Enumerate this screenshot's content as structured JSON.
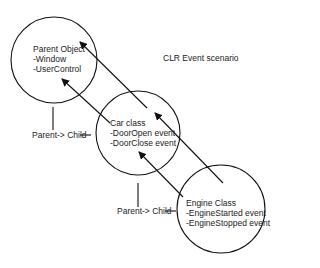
{
  "title": "CLR Event scenario",
  "nodes": [
    {
      "id": "parent",
      "title": "Parent Object",
      "lines": [
        "-Window",
        "-UserControl"
      ]
    },
    {
      "id": "car",
      "title": "Car class",
      "lines": [
        "-DoorOpen event",
        "-DoorClose event"
      ]
    },
    {
      "id": "engine",
      "title": "Engine Class",
      "lines": [
        "-EngineStarted event",
        "-EngineStopped event"
      ]
    }
  ],
  "relations": [
    {
      "label": "Parent-> Child",
      "from": "parent",
      "to": "car"
    },
    {
      "label": "Parent-> Child",
      "from": "car",
      "to": "engine"
    }
  ],
  "arrows": [
    {
      "from": "car",
      "to": "parent"
    },
    {
      "from": "car",
      "to": "parent"
    },
    {
      "from": "engine",
      "to": "car"
    },
    {
      "from": "engine",
      "to": "car"
    }
  ],
  "colors": {
    "stroke": "#111111",
    "text": "#222222",
    "background": "#ffffff"
  }
}
